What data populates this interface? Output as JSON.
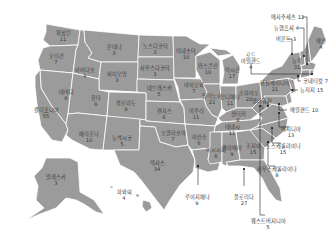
{
  "title": "",
  "colors": {
    "state_fill": "#9b9b9b",
    "border": "#ffffff",
    "text": "#3a3a3a",
    "leader": "#222222",
    "background": "#ffffff"
  },
  "states": [
    {
      "id": "wa",
      "name": "워싱턴",
      "value": "11",
      "x": 63,
      "y": 36
    },
    {
      "id": "or",
      "name": "오리건",
      "value": "7",
      "x": 56,
      "y": 59
    },
    {
      "id": "id",
      "name": "아이다호",
      "value": "4",
      "x": 85,
      "y": 73
    },
    {
      "id": "mt",
      "name": "몬태나",
      "value": "3",
      "x": 114,
      "y": 50
    },
    {
      "id": "nd",
      "name": "노스다코타",
      "value": "3",
      "x": 155,
      "y": 49
    },
    {
      "id": "sd",
      "name": "사우스다코타",
      "value": "3",
      "x": 155,
      "y": 71
    },
    {
      "id": "wy",
      "name": "와이오밍",
      "value": "3",
      "x": 117,
      "y": 77
    },
    {
      "id": "ne",
      "name": "네브래스카",
      "value": "5",
      "x": 159,
      "y": 91
    },
    {
      "id": "nv",
      "name": "네바다",
      "value": "6",
      "x": 66,
      "y": 95
    },
    {
      "id": "ca",
      "name": "캘리포니아",
      "value": "55",
      "x": 46,
      "y": 113
    },
    {
      "id": "ut",
      "name": "유타",
      "value": "6",
      "x": 96,
      "y": 101
    },
    {
      "id": "co",
      "name": "콜로라도",
      "value": "9",
      "x": 126,
      "y": 106
    },
    {
      "id": "ks",
      "name": "캔자스",
      "value": "6",
      "x": 164,
      "y": 114
    },
    {
      "id": "az",
      "name": "애리조나",
      "value": "10",
      "x": 89,
      "y": 137
    },
    {
      "id": "nm",
      "name": "뉴멕시코",
      "value": "5",
      "x": 122,
      "y": 141
    },
    {
      "id": "ok",
      "name": "오클라호마",
      "value": "7",
      "x": 173,
      "y": 136
    },
    {
      "id": "tx",
      "name": "텍사스",
      "value": "34",
      "x": 157,
      "y": 166
    },
    {
      "id": "mn",
      "name": "미네소타",
      "value": "10",
      "x": 186,
      "y": 54
    },
    {
      "id": "ia",
      "name": "아이오와",
      "value": "7",
      "x": 194,
      "y": 88
    },
    {
      "id": "wi",
      "name": "위스콘신",
      "value": "10",
      "x": 208,
      "y": 69
    },
    {
      "id": "mi",
      "name": "미시간",
      "value": "17",
      "x": 232,
      "y": 73
    },
    {
      "id": "il",
      "name": "일리노이",
      "value": "21",
      "x": 212,
      "y": 99
    },
    {
      "id": "in",
      "name": "인디애나",
      "value": "11",
      "x": 230,
      "y": 100
    },
    {
      "id": "oh",
      "name": "오하이오",
      "value": "20",
      "x": 249,
      "y": 96
    },
    {
      "id": "mo",
      "name": "미주리",
      "value": "11",
      "x": 196,
      "y": 114
    },
    {
      "id": "ky",
      "name": "켄터키",
      "value": "8",
      "x": 238,
      "y": 117
    },
    {
      "id": "tn",
      "name": "테네시",
      "value": "11",
      "x": 232,
      "y": 130
    },
    {
      "id": "ar",
      "name": "아칸소",
      "value": "6",
      "x": 199,
      "y": 140
    },
    {
      "id": "ms",
      "name": "미시시피",
      "value": "6",
      "x": 216,
      "y": 153
    },
    {
      "id": "al",
      "name": "앨라배마",
      "value": "9",
      "x": 232,
      "y": 151
    },
    {
      "id": "ga",
      "name": "조지아",
      "value": "15",
      "x": 253,
      "y": 149
    },
    {
      "id": "pa",
      "name": "펜실베이니아",
      "value": "21",
      "x": 275,
      "y": 86
    },
    {
      "id": "ny",
      "name": "뉴욕",
      "value": "31",
      "x": 297,
      "y": 64
    },
    {
      "id": "me",
      "name": "메인",
      "value": "4",
      "x": 321,
      "y": 44
    },
    {
      "id": "ak",
      "name": "알래스카",
      "value": "3",
      "x": 56,
      "y": 180
    },
    {
      "id": "hi",
      "name": "하와이",
      "value": "4",
      "x": 124,
      "y": 195
    }
  ],
  "callouts": [
    {
      "id": "ma",
      "name": "매사추세츠",
      "value": "12",
      "x": 271,
      "y": 17,
      "lx1": 305,
      "ly1": 19,
      "lx2": 307,
      "ly2": 62
    },
    {
      "id": "nh",
      "name": "뉴햄프셔",
      "value": "4",
      "x": 274,
      "y": 28,
      "lx1": 304,
      "ly1": 30,
      "lx2": 305,
      "ly2": 56
    },
    {
      "id": "vt",
      "name": "버몬트",
      "value": "3",
      "x": 276,
      "y": 39,
      "lx1": 292,
      "ly1": 40,
      "lx2": 297,
      "ly2": 54
    },
    {
      "id": "ri",
      "name": "로드\n아일랜드",
      "value": "4",
      "x": 251,
      "y": 52,
      "lx1": 251,
      "ly1": 70,
      "lx2": 307,
      "ly2": 74
    },
    {
      "id": "ct",
      "name": "코네티컷",
      "value": "7",
      "x": 303,
      "y": 81,
      "lx1": 302,
      "ly1": 81,
      "lx2": 299,
      "ly2": 76
    },
    {
      "id": "nj",
      "name": "뉴저지",
      "value": "15",
      "x": 300,
      "y": 90,
      "lx1": 300,
      "ly1": 90,
      "lx2": 291,
      "ly2": 89
    },
    {
      "id": "de",
      "name": "델라웨어",
      "value": "3",
      "x": 262,
      "y": 98,
      "lx1": 268,
      "ly1": 98,
      "lx2": 268,
      "ly2": 100
    },
    {
      "id": "md",
      "name": "메릴랜드",
      "value": "10",
      "x": 290,
      "y": 110,
      "lx1": 289,
      "ly1": 110,
      "lx2": 279,
      "ly2": 110
    },
    {
      "id": "va",
      "name": "버지니아",
      "value": "13",
      "x": 291,
      "y": 126,
      "lx1": 290,
      "ly1": 122,
      "lx2": 279,
      "ly2": 113
    },
    {
      "id": "nc",
      "name": "노스캐롤라이나",
      "value": "15",
      "x": 283,
      "y": 143,
      "lx1": 282,
      "ly1": 138,
      "lx2": 273,
      "ly2": 128
    },
    {
      "id": "sc",
      "name": "사우스캐롤라이나",
      "value": "8",
      "x": 277,
      "y": 166,
      "lx1": 274,
      "ly1": 160,
      "lx2": 267,
      "ly2": 143
    },
    {
      "id": "fl",
      "name": "플로리다",
      "value": "27",
      "x": 244,
      "y": 194,
      "lx1": 244,
      "ly1": 186,
      "lx2": 244,
      "ly2": 170
    },
    {
      "id": "la",
      "name": "루이지애나",
      "value": "9",
      "x": 197,
      "y": 194,
      "lx1": 198,
      "ly1": 185,
      "lx2": 198,
      "ly2": 166
    },
    {
      "id": "wv",
      "name": "웨스트버지니아",
      "value": "5",
      "x": 268,
      "y": 218,
      "lx1": 265,
      "ly1": 210,
      "lx2": 260,
      "ly2": 112
    }
  ]
}
